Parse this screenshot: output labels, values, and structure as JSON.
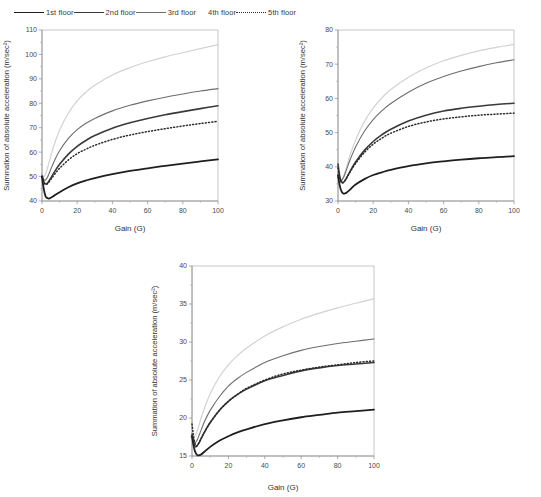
{
  "legend": {
    "items": [
      {
        "label": "1st floor",
        "style": "solid-dark",
        "color": "#1f1f1f"
      },
      {
        "label": "2nd floor",
        "style": "solid-dark",
        "color": "#3a3a3a"
      },
      {
        "label": "3rd floor",
        "style": "solid-medium",
        "color": "#6e6e6e"
      },
      {
        "label": "4th floor",
        "style": "solid-light",
        "color": "#d2d2d2"
      },
      {
        "label": "5th floor",
        "style": "dotted",
        "color": "#2a2a2a"
      }
    ]
  },
  "chart_data": [
    {
      "type": "line",
      "id": "panel-1",
      "title": "",
      "xlabel": "Gain (G)",
      "ylabel": "Summation of absolute acceleration (m/sec²)",
      "xlim": [
        0,
        100
      ],
      "ylim": [
        40,
        110
      ],
      "xticks": [
        0,
        20,
        40,
        60,
        80,
        100
      ],
      "yticks": [
        40,
        50,
        60,
        70,
        80,
        90,
        100,
        110
      ],
      "grid": false,
      "legend_position": "top-outside",
      "x": [
        0,
        1,
        2,
        3,
        4,
        5,
        7,
        10,
        15,
        20,
        25,
        30,
        40,
        50,
        60,
        70,
        80,
        90,
        100
      ],
      "series": [
        {
          "name": "1st floor",
          "color": "#1f1f1f",
          "width": 1.8,
          "dash": "none",
          "values": [
            50.0,
            45.0,
            42.0,
            41.2,
            41.0,
            41.3,
            42.2,
            43.6,
            45.6,
            47.2,
            48.4,
            49.4,
            51.0,
            52.3,
            53.4,
            54.4,
            55.3,
            56.2,
            57.0
          ]
        },
        {
          "name": "2nd floor",
          "color": "#3a3a3a",
          "width": 1.6,
          "dash": "none",
          "values": [
            50.2,
            48.0,
            47.0,
            47.3,
            48.2,
            49.4,
            51.8,
            55.0,
            59.2,
            62.4,
            64.8,
            66.8,
            69.8,
            72.0,
            73.8,
            75.3,
            76.6,
            77.8,
            79.0
          ]
        },
        {
          "name": "3rd floor",
          "color": "#6e6e6e",
          "width": 1.1,
          "dash": "none",
          "values": [
            50.6,
            48.8,
            48.6,
            49.6,
            51.2,
            53.0,
            56.4,
            60.6,
            65.6,
            69.2,
            71.8,
            73.8,
            76.9,
            79.2,
            81.0,
            82.5,
            83.8,
            85.0,
            86.0
          ]
        },
        {
          "name": "4th floor",
          "color": "#d2d2d2",
          "width": 1.2,
          "dash": "none",
          "values": [
            50.8,
            50.0,
            51.0,
            53.2,
            55.8,
            58.4,
            63.2,
            69.0,
            76.0,
            81.0,
            84.6,
            87.4,
            91.6,
            94.6,
            97.0,
            99.0,
            100.7,
            102.4,
            104.0
          ]
        },
        {
          "name": "5th floor",
          "color": "#2a2a2a",
          "width": 1.5,
          "dash": "1,2.2",
          "values": [
            49.8,
            47.6,
            46.8,
            47.0,
            47.8,
            48.8,
            50.8,
            53.4,
            56.8,
            59.4,
            61.2,
            62.8,
            65.2,
            67.0,
            68.4,
            69.6,
            70.7,
            71.7,
            72.6
          ]
        }
      ]
    },
    {
      "type": "line",
      "id": "panel-2",
      "title": "",
      "xlabel": "Gain (G)",
      "ylabel": "Summation of absolute acceleration (m/sec²)",
      "xlim": [
        0,
        100
      ],
      "ylim": [
        30,
        80
      ],
      "xticks": [
        0,
        20,
        40,
        60,
        80,
        100
      ],
      "yticks": [
        30,
        40,
        50,
        60,
        70,
        80
      ],
      "grid": false,
      "legend_position": "top-outside",
      "x": [
        0,
        1,
        2,
        3,
        4,
        5,
        7,
        10,
        15,
        20,
        25,
        30,
        40,
        50,
        60,
        70,
        80,
        90,
        100
      ],
      "series": [
        {
          "name": "1st floor",
          "color": "#1f1f1f",
          "width": 1.8,
          "dash": "none",
          "values": [
            37.5,
            34.5,
            32.8,
            32.2,
            32.2,
            32.5,
            33.4,
            34.8,
            36.4,
            37.6,
            38.4,
            39.1,
            40.2,
            41.0,
            41.6,
            42.1,
            42.5,
            42.8,
            43.1
          ]
        },
        {
          "name": "2nd floor",
          "color": "#3a3a3a",
          "width": 1.6,
          "dash": "none",
          "values": [
            40.8,
            37.2,
            35.6,
            35.4,
            36.0,
            36.9,
            38.8,
            41.4,
            44.8,
            47.4,
            49.4,
            51.0,
            53.4,
            55.1,
            56.3,
            57.1,
            57.7,
            58.2,
            58.6
          ]
        },
        {
          "name": "3rd floor",
          "color": "#6e6e6e",
          "width": 1.1,
          "dash": "none",
          "values": [
            38.0,
            36.4,
            36.0,
            36.8,
            38.0,
            39.4,
            42.2,
            45.8,
            50.4,
            53.8,
            56.4,
            58.5,
            61.8,
            64.4,
            66.4,
            68.0,
            69.3,
            70.4,
            71.3
          ]
        },
        {
          "name": "4th floor",
          "color": "#d2d2d2",
          "width": 1.2,
          "dash": "none",
          "values": [
            36.6,
            35.4,
            35.6,
            36.8,
            38.4,
            40.2,
            43.6,
            47.8,
            53.2,
            57.2,
            60.2,
            62.6,
            66.2,
            68.9,
            71.0,
            72.6,
            73.9,
            74.9,
            75.8
          ]
        },
        {
          "name": "5th floor",
          "color": "#2a2a2a",
          "width": 1.5,
          "dash": "1,2.2",
          "values": [
            39.6,
            36.6,
            35.4,
            35.4,
            36.0,
            36.8,
            38.6,
            41.0,
            44.2,
            46.6,
            48.4,
            49.8,
            51.8,
            53.1,
            54.0,
            54.6,
            55.1,
            55.4,
            55.7
          ]
        }
      ]
    },
    {
      "type": "line",
      "id": "panel-3",
      "title": "",
      "xlabel": "Gain (G)",
      "ylabel": "Summation of absolute acceleration (m/sec²)",
      "xlim": [
        0,
        100
      ],
      "ylim": [
        15,
        40
      ],
      "xticks": [
        0,
        20,
        40,
        60,
        80,
        100
      ],
      "yticks": [
        15,
        20,
        25,
        30,
        35,
        40
      ],
      "grid": false,
      "legend_position": "top-outside",
      "x": [
        0,
        1,
        2,
        3,
        4,
        5,
        7,
        10,
        15,
        20,
        25,
        30,
        40,
        50,
        60,
        70,
        80,
        90,
        100
      ],
      "values_note": "",
      "series": [
        {
          "name": "1st floor",
          "color": "#1f1f1f",
          "width": 1.8,
          "dash": "none",
          "values": [
            17.6,
            16.2,
            15.4,
            15.1,
            15.1,
            15.2,
            15.6,
            16.2,
            17.0,
            17.6,
            18.1,
            18.5,
            19.2,
            19.7,
            20.1,
            20.4,
            20.7,
            20.9,
            21.1
          ]
        },
        {
          "name": "2nd floor",
          "color": "#3a3a3a",
          "width": 1.6,
          "dash": "none",
          "values": [
            17.8,
            16.6,
            16.2,
            16.4,
            16.8,
            17.3,
            18.2,
            19.4,
            21.0,
            22.2,
            23.1,
            23.8,
            24.9,
            25.6,
            26.2,
            26.6,
            26.9,
            27.1,
            27.3
          ]
        },
        {
          "name": "3rd floor",
          "color": "#6e6e6e",
          "width": 1.1,
          "dash": "none",
          "values": [
            18.0,
            17.0,
            16.8,
            17.2,
            17.8,
            18.4,
            19.6,
            21.0,
            22.8,
            24.2,
            25.2,
            26.0,
            27.3,
            28.2,
            28.9,
            29.4,
            29.8,
            30.1,
            30.4
          ]
        },
        {
          "name": "4th floor",
          "color": "#d2d2d2",
          "width": 1.2,
          "dash": "none",
          "values": [
            18.2,
            17.6,
            17.8,
            18.4,
            19.2,
            20.0,
            21.4,
            23.2,
            25.4,
            27.0,
            28.2,
            29.2,
            30.8,
            32.0,
            33.0,
            33.8,
            34.5,
            35.1,
            35.7
          ]
        },
        {
          "name": "5th floor",
          "color": "#2a2a2a",
          "width": 1.5,
          "dash": "1,2.2",
          "values": [
            19.2,
            17.4,
            16.4,
            16.4,
            16.8,
            17.3,
            18.2,
            19.4,
            21.0,
            22.2,
            23.1,
            23.9,
            25.0,
            25.8,
            26.3,
            26.7,
            27.0,
            27.3,
            27.5
          ]
        }
      ]
    }
  ]
}
